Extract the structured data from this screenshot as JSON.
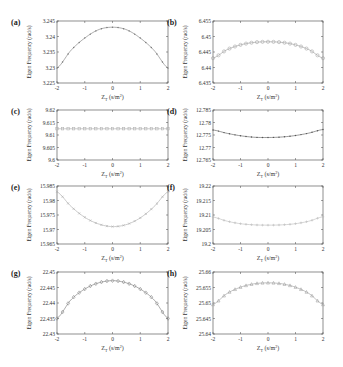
{
  "figure": {
    "y_axis_label": "Eigen Frequency (rad/s)",
    "x_axis_label": "Z",
    "x_axis_sub": "T",
    "x_axis_unit": "(s/m",
    "x_axis_unit_sup": "2",
    "x_axis_unit_close": ")"
  },
  "chart_data": [
    {
      "panel": "(a)",
      "type": "line",
      "xlabel": "Z_T (s/m^2)",
      "ylabel": "Eigen Frequency (rad/s)",
      "xlim": [
        -2,
        2
      ],
      "ylim": [
        3.225,
        3.245
      ],
      "xticks": [
        "-2",
        "-1",
        "0",
        "1",
        "2"
      ],
      "yticks": [
        "3.225",
        "3.23",
        "3.235",
        "3.24",
        "3.245"
      ],
      "marker": "dot",
      "color": "#777777",
      "x": [
        -2,
        -1.5,
        -1,
        -0.5,
        0,
        0.5,
        1,
        1.5,
        2
      ],
      "y": [
        3.2298,
        3.2355,
        3.2395,
        3.2422,
        3.243,
        3.2422,
        3.2395,
        3.2355,
        3.2298
      ]
    },
    {
      "panel": "(b)",
      "type": "line",
      "xlabel": "Z_T (s/m^2)",
      "ylabel": "Eigen Frequency (rad/s)",
      "xlim": [
        -2,
        2
      ],
      "ylim": [
        6.435,
        6.455
      ],
      "xticks": [
        "-2",
        "-1",
        "0",
        "1",
        "2"
      ],
      "yticks": [
        "6.435",
        "6.44",
        "6.445",
        "6.45",
        "6.455"
      ],
      "marker": "circle",
      "color": "#999999",
      "x": [
        -2,
        -1.5,
        -1,
        -0.5,
        0,
        0.5,
        1,
        1.5,
        2
      ],
      "y": [
        6.443,
        6.4457,
        6.4473,
        6.4481,
        6.4483,
        6.4481,
        6.4473,
        6.4457,
        6.443
      ]
    },
    {
      "panel": "(c)",
      "type": "line",
      "xlabel": "Z_T (s/m^2)",
      "ylabel": "Eigen Frequency (rad/s)",
      "xlim": [
        -2,
        2
      ],
      "ylim": [
        9.6,
        9.62
      ],
      "xticks": [
        "-2",
        "-1",
        "0",
        "1",
        "2"
      ],
      "yticks": [
        "9.6",
        "9.605",
        "9.61",
        "9.615",
        "9.62"
      ],
      "marker": "square",
      "color": "#aaaaaa",
      "x": [
        -2,
        -1.5,
        -1,
        -0.5,
        0,
        0.5,
        1,
        1.5,
        2
      ],
      "y": [
        9.6125,
        9.6125,
        9.6125,
        9.6125,
        9.6125,
        9.6125,
        9.6125,
        9.6125,
        9.6125
      ]
    },
    {
      "panel": "(d)",
      "type": "line",
      "xlabel": "Z_T (s/m^2)",
      "ylabel": "Eigen Frequency (rad/s)",
      "xlim": [
        -2,
        2
      ],
      "ylim": [
        12.765,
        12.785
      ],
      "xticks": [
        "-2",
        "-1",
        "0",
        "1",
        "2"
      ],
      "yticks": [
        "12.765",
        "12.77",
        "12.775",
        "12.78",
        "12.785"
      ],
      "marker": "dot",
      "color": "#555555",
      "x": [
        -2,
        -1.5,
        -1,
        -0.5,
        0,
        0.5,
        1,
        1.5,
        2
      ],
      "y": [
        12.777,
        12.7757,
        12.7747,
        12.7741,
        12.774,
        12.7742,
        12.7748,
        12.7758,
        12.7772
      ]
    },
    {
      "panel": "(e)",
      "type": "line",
      "xlabel": "Z_T (s/m^2)",
      "ylabel": "Eigen Frequency (rad/s)",
      "xlim": [
        -2,
        2
      ],
      "ylim": [
        15.965,
        15.985
      ],
      "xticks": [
        "-2",
        "-1",
        "0",
        "1",
        "2"
      ],
      "yticks": [
        "15.965",
        "15.97",
        "15.975",
        "15.98",
        "15.985"
      ],
      "marker": "x",
      "color": "#aaaaaa",
      "x": [
        -2,
        -1.5,
        -1,
        -0.5,
        0,
        0.5,
        1,
        1.5,
        2
      ],
      "y": [
        15.983,
        15.978,
        15.9742,
        15.9719,
        15.971,
        15.9717,
        15.974,
        15.9779,
        15.983
      ]
    },
    {
      "panel": "(f)",
      "type": "line",
      "xlabel": "Z_T (s/m^2)",
      "ylabel": "Eigen Frequency (rad/s)",
      "xlim": [
        -2,
        2
      ],
      "ylim": [
        19.2,
        19.22
      ],
      "xticks": [
        "-2",
        "-1",
        "0",
        "1",
        "2"
      ],
      "yticks": [
        "19.2",
        "19.205",
        "19.21",
        "19.215",
        "19.22"
      ],
      "marker": "plus",
      "color": "#bbbbbb",
      "x": [
        -2,
        -1.5,
        -1,
        -0.5,
        0,
        0.5,
        1,
        1.5,
        2
      ],
      "y": [
        19.2093,
        19.2079,
        19.207,
        19.2066,
        19.2065,
        19.2066,
        19.207,
        19.2079,
        19.2094
      ]
    },
    {
      "panel": "(g)",
      "type": "line",
      "xlabel": "Z_T (s/m^2)",
      "ylabel": "Eigen Frequency (rad/s)",
      "xlim": [
        -2,
        2
      ],
      "ylim": [
        22.43,
        22.45
      ],
      "xticks": [
        "-2",
        "-1",
        "0",
        "1",
        "2"
      ],
      "yticks": [
        "22.43",
        "22.435",
        "22.44",
        "22.445",
        "22.45"
      ],
      "marker": "diamond",
      "color": "#777777",
      "x": [
        -2,
        -1.5,
        -1,
        -0.5,
        0,
        0.5,
        1,
        1.5,
        2
      ],
      "y": [
        22.435,
        22.441,
        22.4445,
        22.4465,
        22.4472,
        22.4465,
        22.4445,
        22.441,
        22.435
      ]
    },
    {
      "panel": "(h)",
      "type": "line",
      "xlabel": "Z_T (s/m^2)",
      "ylabel": "Eigen Frequency (rad/s)",
      "xlim": [
        -2,
        2
      ],
      "ylim": [
        25.64,
        25.66
      ],
      "xticks": [
        "-2",
        "-1",
        "0",
        "1",
        "2"
      ],
      "yticks": [
        "25.64",
        "25.645",
        "25.65",
        "25.655",
        "25.66"
      ],
      "marker": "triangle",
      "color": "#999999",
      "x": [
        -2,
        -1.5,
        -1,
        -0.5,
        0,
        0.5,
        1,
        1.5,
        2
      ],
      "y": [
        25.6495,
        25.653,
        25.6551,
        25.6562,
        25.6565,
        25.6562,
        25.6551,
        25.653,
        25.6495
      ]
    }
  ]
}
